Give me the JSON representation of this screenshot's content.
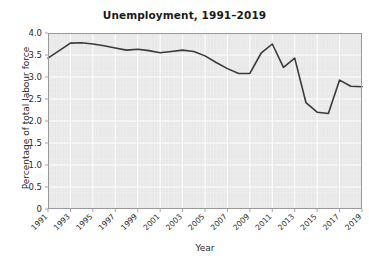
{
  "chart_data": {
    "type": "line",
    "title": "Unemployment, 1991–2019",
    "xlabel": "Year",
    "ylabel": "Percentage of total labour force",
    "grid": true,
    "legend": "none",
    "xlim": [
      1991,
      2019
    ],
    "ylim": [
      0,
      4.0
    ],
    "ytick_labels": [
      "0",
      "0.5",
      "1.0",
      "1.5",
      "2.0",
      "2.5",
      "3.0",
      "3.5",
      "4.0"
    ],
    "ytick_values": [
      0,
      0.5,
      1.0,
      1.5,
      2.0,
      2.5,
      3.0,
      3.5,
      4.0
    ],
    "xtick_labels": [
      "1991",
      "1993",
      "1995",
      "1997",
      "1999",
      "2001",
      "2003",
      "2005",
      "2007",
      "2009",
      "2011",
      "2013",
      "2015",
      "2017",
      "2019"
    ],
    "xtick_values": [
      1991,
      1993,
      1995,
      1997,
      1999,
      2001,
      2003,
      2005,
      2007,
      2009,
      2011,
      2013,
      2015,
      2017,
      2019
    ],
    "x": [
      1991,
      1992,
      1993,
      1994,
      1995,
      1996,
      1997,
      1998,
      1999,
      2000,
      2001,
      2002,
      2003,
      2004,
      2005,
      2006,
      2007,
      2008,
      2009,
      2010,
      2011,
      2012,
      2013,
      2014,
      2015,
      2016,
      2017,
      2018,
      2019
    ],
    "values": [
      3.43,
      3.6,
      3.77,
      3.78,
      3.75,
      3.71,
      3.66,
      3.61,
      3.63,
      3.6,
      3.55,
      3.58,
      3.61,
      3.58,
      3.48,
      3.33,
      3.19,
      3.08,
      3.08,
      3.54,
      3.75,
      3.22,
      3.43,
      2.42,
      2.2,
      2.17,
      2.93,
      2.79,
      2.78
    ],
    "series_name": "Unemployment",
    "line_color": "#3a3a3a",
    "plot_bg": "#e8e8e8",
    "grid_color": "#ffffff",
    "figure_bg": "#ffffff"
  },
  "layout": {
    "plot_left": 48,
    "plot_top": 33,
    "plot_right": 362,
    "plot_bottom": 209
  }
}
